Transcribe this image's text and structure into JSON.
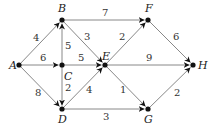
{
  "diagram": {
    "type": "weighted-directed-graph",
    "nodes": [
      {
        "id": "A",
        "label": "A",
        "x": 19,
        "y": 65,
        "lx": 9,
        "ly": 69
      },
      {
        "id": "B",
        "label": "B",
        "x": 62,
        "y": 20,
        "lx": 58,
        "ly": 12
      },
      {
        "id": "C",
        "label": "C",
        "x": 62,
        "y": 65,
        "lx": 64,
        "ly": 80
      },
      {
        "id": "D",
        "label": "D",
        "x": 62,
        "y": 109,
        "lx": 58,
        "ly": 123
      },
      {
        "id": "E",
        "label": "E",
        "x": 105,
        "y": 65,
        "lx": 102,
        "ly": 60
      },
      {
        "id": "F",
        "label": "F",
        "x": 148,
        "y": 20,
        "lx": 145,
        "ly": 12
      },
      {
        "id": "G",
        "label": "G",
        "x": 148,
        "y": 109,
        "lx": 144,
        "ly": 123
      },
      {
        "id": "H",
        "label": "H",
        "x": 193,
        "y": 65,
        "lx": 198,
        "ly": 69
      }
    ],
    "edges": [
      {
        "from": "A",
        "to": "B",
        "weight": "4",
        "lx": 33,
        "ly": 41
      },
      {
        "from": "A",
        "to": "C",
        "weight": "6",
        "lx": 40,
        "ly": 61
      },
      {
        "from": "A",
        "to": "D",
        "weight": "8",
        "lx": 35,
        "ly": 96
      },
      {
        "from": "C",
        "to": "B",
        "weight": "5",
        "lx": 65,
        "ly": 49
      },
      {
        "from": "C",
        "to": "E",
        "weight": "5",
        "lx": 78,
        "ly": 61
      },
      {
        "from": "C",
        "to": "D",
        "weight": "2",
        "lx": 65,
        "ly": 91
      },
      {
        "from": "B",
        "to": "E",
        "weight": "3",
        "lx": 84,
        "ly": 40
      },
      {
        "from": "B",
        "to": "F",
        "weight": "7",
        "lx": 102,
        "ly": 16
      },
      {
        "from": "D",
        "to": "E",
        "weight": "4",
        "lx": 86,
        "ly": 93
      },
      {
        "from": "E",
        "to": "F",
        "weight": "2",
        "lx": 119,
        "ly": 40
      },
      {
        "from": "E",
        "to": "H",
        "weight": "9",
        "lx": 146,
        "ly": 61
      },
      {
        "from": "E",
        "to": "G",
        "weight": "1",
        "lx": 120,
        "ly": 93
      },
      {
        "from": "D",
        "to": "G",
        "weight": "3",
        "lx": 103,
        "ly": 120
      },
      {
        "from": "F",
        "to": "H",
        "weight": "6",
        "lx": 173,
        "ly": 40
      },
      {
        "from": "G",
        "to": "H",
        "weight": "2",
        "lx": 174,
        "ly": 96
      }
    ]
  }
}
